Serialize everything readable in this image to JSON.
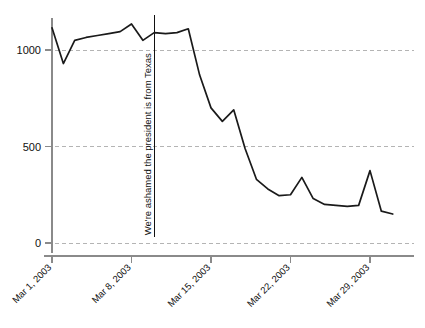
{
  "chart_data": {
    "type": "line",
    "title": "",
    "subtitle": "",
    "xlabel": "",
    "ylabel": "",
    "grid": true,
    "legend": null,
    "ylim": [
      0,
      1200
    ],
    "yticks": [
      0,
      500,
      1000
    ],
    "ytick_labels": [
      "0",
      "500",
      "1000"
    ],
    "xlim": [
      "Mar 1, 2003",
      "Mar 31, 2003"
    ],
    "xticks": [
      "Mar 1, 2003",
      "Mar 8, 2003",
      "Mar 15, 2003",
      "Mar 22, 2003",
      "Mar 29, 2003"
    ],
    "xtick_days": [
      1,
      8,
      15,
      22,
      29
    ],
    "x": [
      1,
      2,
      3,
      4,
      5,
      6,
      7,
      8,
      9,
      10,
      11,
      12,
      13,
      14,
      15,
      16,
      17,
      18,
      19,
      20,
      21,
      22,
      23,
      24,
      25,
      26,
      27,
      28,
      29,
      30,
      31
    ],
    "values": [
      1115,
      930,
      1050,
      1065,
      1075,
      1085,
      1095,
      1135,
      1050,
      1090,
      1085,
      1090,
      1110,
      870,
      700,
      630,
      690,
      490,
      330,
      280,
      245,
      250,
      340,
      230,
      200,
      195,
      190,
      195,
      375,
      165,
      150
    ],
    "series": [
      {
        "name": "blog mentions",
        "color": "#1a1a1a",
        "values": [
          1115,
          930,
          1050,
          1065,
          1075,
          1085,
          1095,
          1135,
          1050,
          1090,
          1085,
          1090,
          1110,
          870,
          700,
          630,
          690,
          490,
          330,
          280,
          245,
          250,
          340,
          230,
          200,
          195,
          190,
          195,
          375,
          165,
          150
        ]
      }
    ],
    "annotations": [
      {
        "text": "We're ashamed the president is from Texas",
        "x_day": 10,
        "orientation": "vertical",
        "line_top_value": 1180,
        "line_bottom_value": 30
      }
    ],
    "colors": {
      "line": "#1a1a1a",
      "grid": "#b4b4b4",
      "axis": "#8a8a8a",
      "text": "#111111",
      "background": "#ffffff"
    }
  }
}
